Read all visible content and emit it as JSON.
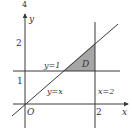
{
  "figure": {
    "top_label": "4",
    "axes": {
      "x_label": "x",
      "y_label": "y",
      "origin_label": "O",
      "x_tick": "2",
      "y_ticks": [
        "1",
        "2"
      ]
    },
    "lines": [
      {
        "label": "y=1",
        "kind": "horizontal",
        "value": 1
      },
      {
        "label": "x=2",
        "kind": "vertical",
        "value": 2
      },
      {
        "label": "y=x",
        "kind": "diagonal"
      }
    ],
    "region": {
      "label": "D",
      "vertices": [
        [
          1,
          1
        ],
        [
          2,
          1
        ],
        [
          2,
          2
        ]
      ],
      "fill": "#a6a6a6"
    },
    "colors": {
      "stroke": "#3a3a3a",
      "text": "#333333"
    }
  }
}
